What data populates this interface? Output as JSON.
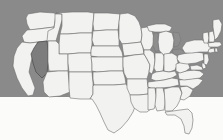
{
  "figure": {
    "kind": "choropleth-locator-map",
    "highlighted_state": "Nevada",
    "highlighted_state_abbr": "NV",
    "width": 223,
    "height": 140
  },
  "colors": {
    "background_upper": "#8a8a8a",
    "background_lower": "#fbfbfa",
    "state_fill": "#f2f2f0",
    "state_border": "#6f6f6f",
    "highlight_fill": "#7d7d7d",
    "highlight_border": "#4a4a4a",
    "lake_fill": "#8e8e8e"
  },
  "background": {
    "upper_band_height": 97,
    "lower_band_height": 43
  },
  "states": [
    {
      "abbr": "WA",
      "name": "Washington",
      "highlighted": false
    },
    {
      "abbr": "OR",
      "name": "Oregon",
      "highlighted": false
    },
    {
      "abbr": "CA",
      "name": "California",
      "highlighted": false
    },
    {
      "abbr": "NV",
      "name": "Nevada",
      "highlighted": true
    },
    {
      "abbr": "ID",
      "name": "Idaho",
      "highlighted": false
    },
    {
      "abbr": "MT",
      "name": "Montana",
      "highlighted": false
    },
    {
      "abbr": "WY",
      "name": "Wyoming",
      "highlighted": false
    },
    {
      "abbr": "UT",
      "name": "Utah",
      "highlighted": false
    },
    {
      "abbr": "AZ",
      "name": "Arizona",
      "highlighted": false
    },
    {
      "abbr": "CO",
      "name": "Colorado",
      "highlighted": false
    },
    {
      "abbr": "NM",
      "name": "New Mexico",
      "highlighted": false
    },
    {
      "abbr": "ND",
      "name": "North Dakota",
      "highlighted": false
    },
    {
      "abbr": "SD",
      "name": "South Dakota",
      "highlighted": false
    },
    {
      "abbr": "NE",
      "name": "Nebraska",
      "highlighted": false
    },
    {
      "abbr": "KS",
      "name": "Kansas",
      "highlighted": false
    },
    {
      "abbr": "OK",
      "name": "Oklahoma",
      "highlighted": false
    },
    {
      "abbr": "TX",
      "name": "Texas",
      "highlighted": false
    },
    {
      "abbr": "MN",
      "name": "Minnesota",
      "highlighted": false
    },
    {
      "abbr": "IA",
      "name": "Iowa",
      "highlighted": false
    },
    {
      "abbr": "MO",
      "name": "Missouri",
      "highlighted": false
    },
    {
      "abbr": "AR",
      "name": "Arkansas",
      "highlighted": false
    },
    {
      "abbr": "LA",
      "name": "Louisiana",
      "highlighted": false
    },
    {
      "abbr": "WI",
      "name": "Wisconsin",
      "highlighted": false
    },
    {
      "abbr": "IL",
      "name": "Illinois",
      "highlighted": false
    },
    {
      "abbr": "MI",
      "name": "Michigan",
      "highlighted": false
    },
    {
      "abbr": "IN",
      "name": "Indiana",
      "highlighted": false
    },
    {
      "abbr": "OH",
      "name": "Ohio",
      "highlighted": false
    },
    {
      "abbr": "KY",
      "name": "Kentucky",
      "highlighted": false
    },
    {
      "abbr": "TN",
      "name": "Tennessee",
      "highlighted": false
    },
    {
      "abbr": "MS",
      "name": "Mississippi",
      "highlighted": false
    },
    {
      "abbr": "AL",
      "name": "Alabama",
      "highlighted": false
    },
    {
      "abbr": "GA",
      "name": "Georgia",
      "highlighted": false
    },
    {
      "abbr": "FL",
      "name": "Florida",
      "highlighted": false
    },
    {
      "abbr": "SC",
      "name": "South Carolina",
      "highlighted": false
    },
    {
      "abbr": "NC",
      "name": "North Carolina",
      "highlighted": false
    },
    {
      "abbr": "VA",
      "name": "Virginia",
      "highlighted": false
    },
    {
      "abbr": "WV",
      "name": "West Virginia",
      "highlighted": false
    },
    {
      "abbr": "MD",
      "name": "Maryland",
      "highlighted": false
    },
    {
      "abbr": "DE",
      "name": "Delaware",
      "highlighted": false
    },
    {
      "abbr": "PA",
      "name": "Pennsylvania",
      "highlighted": false
    },
    {
      "abbr": "NJ",
      "name": "New Jersey",
      "highlighted": false
    },
    {
      "abbr": "NY",
      "name": "New York",
      "highlighted": false
    },
    {
      "abbr": "CT",
      "name": "Connecticut",
      "highlighted": false
    },
    {
      "abbr": "RI",
      "name": "Rhode Island",
      "highlighted": false
    },
    {
      "abbr": "MA",
      "name": "Massachusetts",
      "highlighted": false
    },
    {
      "abbr": "VT",
      "name": "Vermont",
      "highlighted": false
    },
    {
      "abbr": "NH",
      "name": "New Hampshire",
      "highlighted": false
    },
    {
      "abbr": "ME",
      "name": "Maine",
      "highlighted": false
    }
  ],
  "water_bodies": [
    {
      "name": "Lake Michigan"
    },
    {
      "name": "Lake Superior"
    },
    {
      "name": "Lake Huron"
    },
    {
      "name": "Lake Erie"
    },
    {
      "name": "Chesapeake Bay"
    }
  ]
}
